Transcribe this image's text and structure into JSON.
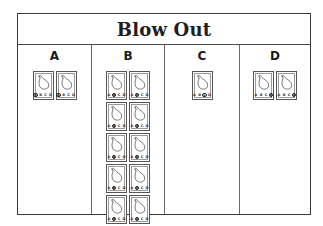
{
  "title": "Blow Out",
  "columns": [
    {
      "label": "A",
      "count": 2,
      "selected": "A"
    },
    {
      "label": "B",
      "count": 11,
      "selected": "B"
    },
    {
      "label": "C",
      "count": 1,
      "selected": "C"
    },
    {
      "label": "D",
      "count": 2,
      "selected": "D"
    }
  ],
  "card": {
    "icon": "balloon-icon",
    "options": [
      "A",
      "B",
      "C",
      "D"
    ]
  },
  "colors": {
    "border": "#3a3a3a",
    "text": "#1e1e1e",
    "background": "#ffffff"
  }
}
